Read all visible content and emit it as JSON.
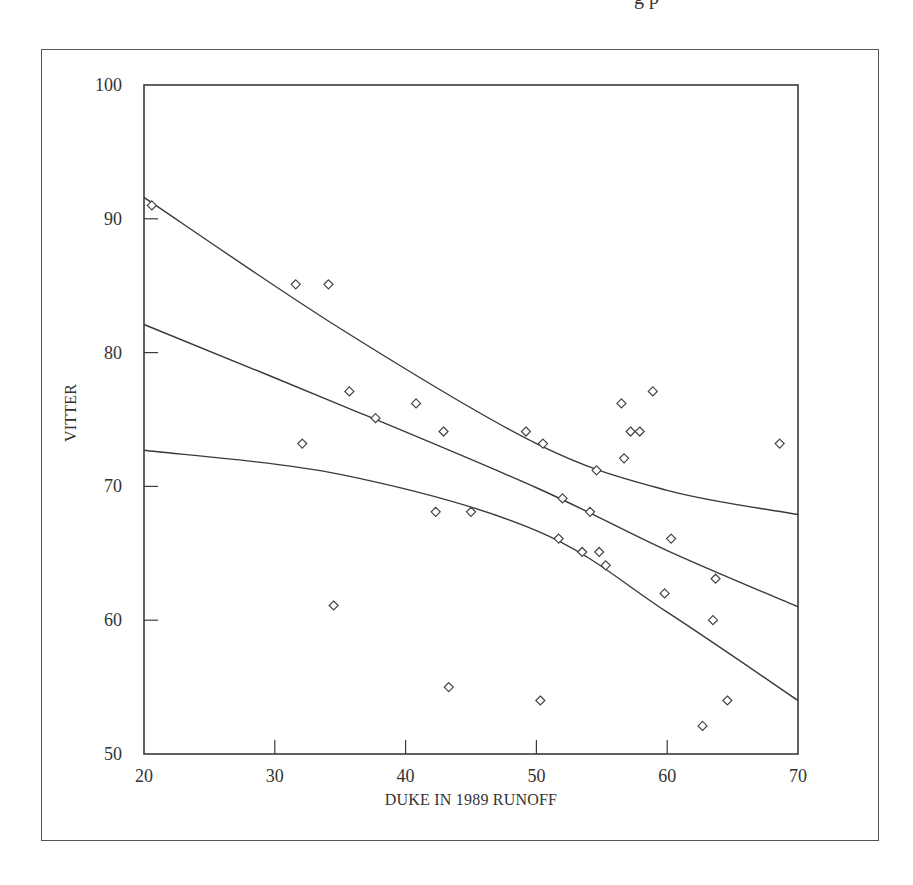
{
  "page": {
    "clipped_header_text": "g p"
  },
  "chart_data": {
    "type": "scatter",
    "title": "",
    "xlabel": "DUKE IN 1989 RUNOFF",
    "ylabel": "VITTER",
    "xlim": [
      20,
      70
    ],
    "ylim": [
      50,
      100
    ],
    "x_ticks": [
      20,
      30,
      40,
      50,
      60,
      70
    ],
    "y_ticks": [
      50,
      60,
      70,
      80,
      90,
      100
    ],
    "x_tick_labels": [
      "20",
      "30",
      "40",
      "50",
      "60",
      "70"
    ],
    "y_tick_labels": [
      "50",
      "60",
      "70",
      "80",
      "90",
      "100"
    ],
    "grid": false,
    "legend": null,
    "marker": "open-diamond",
    "points": [
      {
        "x": 20.6,
        "y": 91.0
      },
      {
        "x": 31.6,
        "y": 85.1
      },
      {
        "x": 34.1,
        "y": 85.1
      },
      {
        "x": 35.7,
        "y": 77.1
      },
      {
        "x": 37.7,
        "y": 75.1
      },
      {
        "x": 40.8,
        "y": 76.2
      },
      {
        "x": 42.9,
        "y": 74.1
      },
      {
        "x": 32.1,
        "y": 73.2
      },
      {
        "x": 42.3,
        "y": 68.1
      },
      {
        "x": 45.0,
        "y": 68.1
      },
      {
        "x": 34.5,
        "y": 61.1
      },
      {
        "x": 43.3,
        "y": 55.0
      },
      {
        "x": 49.2,
        "y": 74.1
      },
      {
        "x": 50.5,
        "y": 73.2
      },
      {
        "x": 56.5,
        "y": 76.2
      },
      {
        "x": 58.9,
        "y": 77.1
      },
      {
        "x": 57.2,
        "y": 74.1
      },
      {
        "x": 57.9,
        "y": 74.1
      },
      {
        "x": 56.7,
        "y": 72.1
      },
      {
        "x": 54.6,
        "y": 71.2
      },
      {
        "x": 52.0,
        "y": 69.1
      },
      {
        "x": 54.1,
        "y": 68.1
      },
      {
        "x": 51.7,
        "y": 66.1
      },
      {
        "x": 53.5,
        "y": 65.1
      },
      {
        "x": 54.8,
        "y": 65.1
      },
      {
        "x": 55.3,
        "y": 64.1
      },
      {
        "x": 60.3,
        "y": 66.1
      },
      {
        "x": 59.8,
        "y": 62.0
      },
      {
        "x": 63.7,
        "y": 63.1
      },
      {
        "x": 63.5,
        "y": 60.0
      },
      {
        "x": 50.3,
        "y": 54.0
      },
      {
        "x": 64.6,
        "y": 54.0
      },
      {
        "x": 62.7,
        "y": 52.1
      },
      {
        "x": 68.6,
        "y": 73.2
      }
    ],
    "series": [
      {
        "name": "regression fit",
        "type": "line",
        "x": [
          20,
          35,
          50,
          60,
          70
        ],
        "y": [
          82.1,
          76.1,
          69.9,
          65.2,
          61.0
        ]
      },
      {
        "name": "upper confidence band",
        "type": "line",
        "x": [
          20,
          35,
          50,
          60,
          70
        ],
        "y": [
          91.6,
          81.8,
          73.2,
          69.7,
          67.9
        ]
      },
      {
        "name": "lower confidence band",
        "type": "line",
        "x": [
          20,
          35,
          50,
          60,
          70
        ],
        "y": [
          72.7,
          70.9,
          66.7,
          60.6,
          54.0
        ]
      }
    ]
  }
}
